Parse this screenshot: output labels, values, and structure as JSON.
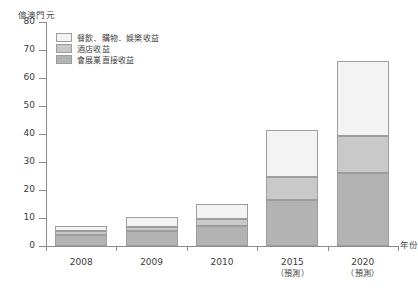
{
  "chart_data": {
    "type": "bar",
    "stacked": true,
    "title": "",
    "subtitle": "",
    "xlabel": "年份",
    "ylabel": "億澳門元",
    "ylim": [
      0,
      80
    ],
    "ytick_step": 10,
    "yticks": [
      0,
      10,
      20,
      30,
      40,
      50,
      60,
      70,
      80
    ],
    "grid": false,
    "legend_position": "top-left",
    "categories": [
      "2008",
      "2009",
      "2010",
      "2015",
      "2020"
    ],
    "category_notes": [
      "",
      "",
      "",
      "（預測）",
      "（預測）"
    ],
    "series": [
      {
        "name": "會展業直接收益",
        "color": "#b3b3b3",
        "values": [
          4.0,
          5.4,
          7.0,
          16.4,
          26.0
        ]
      },
      {
        "name": "酒店收益",
        "color": "#c9c9c9",
        "values": [
          1.2,
          1.5,
          2.6,
          8.2,
          13.2
        ]
      },
      {
        "name": "餐飲．購物．娛樂收益",
        "color": "#f3f3f3",
        "values": [
          1.9,
          3.6,
          5.4,
          16.9,
          26.8
        ]
      }
    ],
    "totals": [
      7.1,
      10.5,
      15.0,
      41.5,
      66.0
    ]
  }
}
